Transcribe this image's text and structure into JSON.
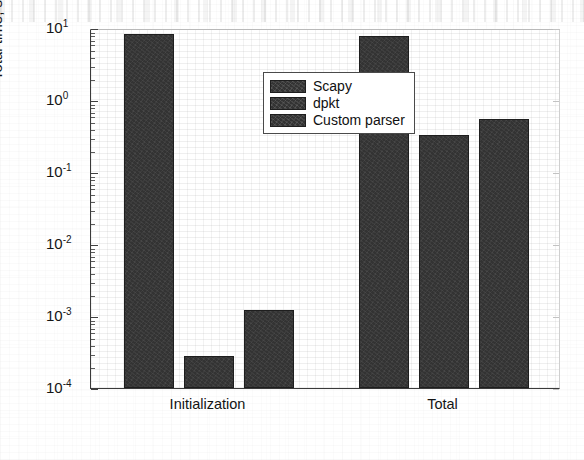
{
  "chart_data": {
    "type": "bar",
    "title": "",
    "xlabel": "",
    "ylabel": "Total time, s",
    "yscale": "log",
    "ylim": [
      0.0001,
      10
    ],
    "grid": true,
    "legend_position": "top-center",
    "categories": [
      "Initialization",
      "Total"
    ],
    "series": [
      {
        "name": "Scapy",
        "values": [
          8.2,
          7.8
        ]
      },
      {
        "name": "dpkt",
        "values": [
          0.00028,
          0.33
        ]
      },
      {
        "name": "Custom parser",
        "values": [
          0.0012,
          0.55
        ]
      }
    ],
    "ytick_labels": [
      {
        "mantissa": "10",
        "exponent": "1",
        "value": 10
      },
      {
        "mantissa": "10",
        "exponent": "0",
        "value": 1
      },
      {
        "mantissa": "10",
        "exponent": "-1",
        "value": 0.1
      },
      {
        "mantissa": "10",
        "exponent": "-2",
        "value": 0.01
      },
      {
        "mantissa": "10",
        "exponent": "-3",
        "value": 0.001
      },
      {
        "mantissa": "10",
        "exponent": "-4",
        "value": 0.0001
      }
    ],
    "colors": {
      "bar_fill": "#333333",
      "bar_edge": "#1e1e1e",
      "axis": "#3a3a3a",
      "text": "#141414",
      "background": "#ffffff"
    }
  },
  "legend": {
    "entries": [
      {
        "label": "Scapy"
      },
      {
        "label": "dpkt"
      },
      {
        "label": "Custom parser"
      }
    ]
  },
  "axes": {
    "y_title": "Total time, s",
    "x_categories": [
      "Initialization",
      "Total"
    ]
  }
}
